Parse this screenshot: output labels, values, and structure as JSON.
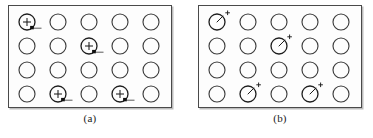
{
  "figure": {
    "width": 373,
    "height": 138,
    "background_color": "#ffffff",
    "panel_count": 2
  },
  "style": {
    "circle_stroke_color": "#3c3c3c",
    "marked_stroke_color": "#1d1d1d",
    "panel_border_color": "#4a4a4a",
    "panel_fill_color": "#fdfdfd",
    "shadow_color": "#bdbdbd",
    "marker_blob_color": "#101010"
  },
  "grid": {
    "rows": 4,
    "columns": 5,
    "circle_radius": 8,
    "column_spacing": 31,
    "row_spacing": 24,
    "first_column_x": 26,
    "first_row_y": 21
  },
  "panels": [
    {
      "id": "panel-a",
      "caption": "(a)",
      "box": {
        "x": 8,
        "y": 5,
        "width": 164,
        "height": 103
      },
      "caption_y": 113,
      "marker_style": "plus-inside-with-tail",
      "marker_description": "circle with a plus sign centered inside and a small filled blob with short horizontal tail at the lower-right rim",
      "marked_cells": [
        {
          "row": 1,
          "col": 1
        },
        {
          "row": 2,
          "col": 3
        },
        {
          "row": 4,
          "col": 2
        },
        {
          "row": 4,
          "col": 4
        }
      ]
    },
    {
      "id": "panel-b",
      "caption": "(b)",
      "box": {
        "x": 198,
        "y": 5,
        "width": 164,
        "height": 103
      },
      "caption_y": 113,
      "marker_style": "radius-with-external-plus",
      "marker_description": "circle with a short radius line drawn from the center toward the upper-right and a small plus sign just outside the upper-right rim",
      "marked_cells": [
        {
          "row": 1,
          "col": 1
        },
        {
          "row": 2,
          "col": 3
        },
        {
          "row": 4,
          "col": 2
        },
        {
          "row": 4,
          "col": 4
        }
      ]
    }
  ]
}
